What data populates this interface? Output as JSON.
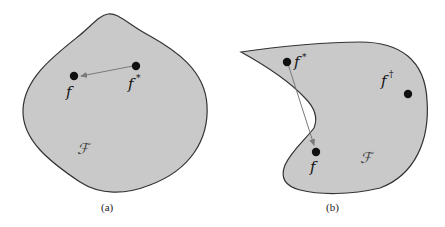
{
  "figure": {
    "panels": [
      {
        "id": "a",
        "caption": "(a)",
        "region_label": "ℱ",
        "points": [
          {
            "name": "f",
            "label": "f",
            "sup": ""
          },
          {
            "name": "f-star",
            "label": "f",
            "sup": "*"
          }
        ],
        "arrow": {
          "from": "f-star",
          "to": "f"
        }
      },
      {
        "id": "b",
        "caption": "(b)",
        "region_label": "ℱ",
        "points": [
          {
            "name": "f-star",
            "label": "f",
            "sup": "*"
          },
          {
            "name": "f",
            "label": "f",
            "sup": ""
          },
          {
            "name": "f-dagger",
            "label": "f",
            "sup": "†"
          }
        ],
        "arrow": {
          "from": "f-star",
          "to": "f"
        }
      }
    ],
    "colors": {
      "region_fill": "#c9c9c9",
      "outline": "#333333",
      "arrow": "#7a7a7a",
      "point": "#111111"
    }
  }
}
